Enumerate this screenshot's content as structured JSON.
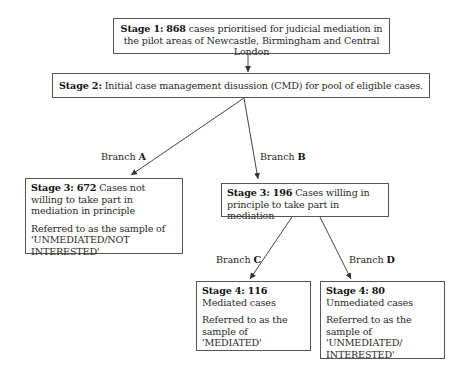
{
  "stage1": {
    "label": "Stage 1:",
    "count": "868",
    "text": " cases prioritised for judicial mediation in the pilot areas of Newcastle, Birmingham and Central London"
  },
  "stage2": {
    "label": "Stage 2:",
    "text": " Initial case management disussion (CMD) for pool of eligible cases."
  },
  "stage3_left": {
    "label": "Stage 3:",
    "count": "672",
    "text": " Cases not willing to take part in mediation in principle",
    "note": "Referred to as the sample of 'UNMEDIATED/NOT INTERESTED'"
  },
  "stage3_right": {
    "label": "Stage 3:",
    "count": "196",
    "text": " Cases willing in principle to take part in mediation"
  },
  "stage4_left": {
    "label": "Stage 4:",
    "count": "116",
    "text": " Mediated cases",
    "note": "Referred to as the sample of 'MEDIATED'"
  },
  "stage4_right": {
    "label": "Stage 4:",
    "count": "80",
    "text": " Unmediated cases",
    "note": "Referred to as the sample of 'UNMEDIATED/ INTERESTED'"
  },
  "branches": {
    "a": {
      "prefix": "Branch ",
      "letter": "A"
    },
    "b": {
      "prefix": "Branch ",
      "letter": "B"
    },
    "c": {
      "prefix": "Branch ",
      "letter": "C"
    },
    "d": {
      "prefix": "Branch ",
      "letter": "D"
    }
  },
  "colors": {
    "line": "#444444",
    "border": "#555555",
    "text": "#2a2a2a"
  }
}
